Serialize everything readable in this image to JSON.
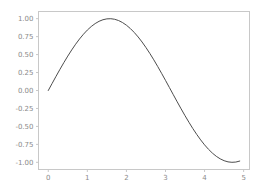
{
  "chart_data": {
    "type": "line",
    "title": "",
    "xlabel": "",
    "ylabel": "",
    "xlim": [
      -0.25,
      5.15
    ],
    "ylim": [
      -1.1,
      1.1
    ],
    "grid": false,
    "legend": null,
    "xticks": [
      "0",
      "1",
      "2",
      "3",
      "4",
      "5"
    ],
    "xtick_values": [
      0,
      1,
      2,
      3,
      4,
      5
    ],
    "yticks": [
      "1.00",
      "0.75",
      "0.50",
      "0.25",
      "0.00",
      "-0.25",
      "-0.50",
      "-0.75",
      "-1.00"
    ],
    "ytick_values": [
      1.0,
      0.75,
      0.5,
      0.25,
      0.0,
      -0.25,
      -0.5,
      -0.75,
      -1.0
    ],
    "series": [
      {
        "name": "sin(x)",
        "color": "#4d4d4d",
        "linewidth": 1,
        "x": [
          0.0,
          0.1,
          0.2,
          0.3,
          0.4,
          0.5,
          0.6,
          0.7,
          0.8,
          0.9,
          1.0,
          1.1,
          1.2,
          1.3,
          1.4,
          1.5,
          1.6,
          1.7,
          1.8,
          1.9,
          2.0,
          2.1,
          2.2,
          2.3,
          2.4,
          2.5,
          2.6,
          2.7,
          2.8,
          2.9,
          3.0,
          3.1,
          3.2,
          3.3,
          3.4,
          3.5,
          3.6,
          3.7,
          3.8,
          3.9,
          4.0,
          4.1,
          4.2,
          4.3,
          4.4,
          4.5,
          4.6,
          4.7,
          4.8,
          4.9
        ],
        "y": [
          0.0,
          0.0998,
          0.1987,
          0.2955,
          0.3894,
          0.4794,
          0.5646,
          0.6442,
          0.7174,
          0.7833,
          0.8415,
          0.8912,
          0.932,
          0.9636,
          0.9854,
          0.9975,
          0.9996,
          0.9917,
          0.9738,
          0.9463,
          0.9093,
          0.8632,
          0.8085,
          0.7457,
          0.6755,
          0.5985,
          0.5155,
          0.4274,
          0.335,
          0.2392,
          0.1411,
          0.0416,
          -0.0584,
          -0.1577,
          -0.2555,
          -0.3508,
          -0.4425,
          -0.5298,
          -0.6119,
          -0.6878,
          -0.7568,
          -0.8183,
          -0.8716,
          -0.9162,
          -0.9516,
          -0.9775,
          -0.9937,
          -0.99992,
          -0.9962,
          -0.9825
        ]
      }
    ],
    "colors": {
      "background": "#ffffff",
      "frame": "#c8c8c8",
      "tick_label": "#8a8a8a",
      "line": "#4d4d4d"
    }
  }
}
